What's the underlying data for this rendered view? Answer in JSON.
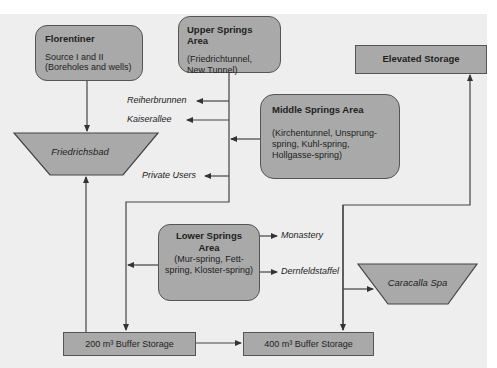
{
  "diagram": {
    "nodes": {
      "florentiner": {
        "title": "Florentiner",
        "line1": "Source I and II",
        "line2": "(Boreholes and wells)"
      },
      "upper_springs": {
        "title": "Upper Springs Area",
        "detail": "(Friedrichtunnel,   New Tunnel)"
      },
      "elevated_storage": {
        "title": "Elevated Storage"
      },
      "friedrichsbad": {
        "label": "Friedrichsbad"
      },
      "middle_springs": {
        "title": "Middle Springs Area",
        "detail": "(Kirchentunnel, Unsprung-spring, Kuhl-spring, Hollgasse-spring)"
      },
      "lower_springs": {
        "title": "Lower Springs Area",
        "detail": "(Mur-spring, Fett-spring, Kloster-spring)"
      },
      "caracalla_spa": {
        "label": "Caracalla Spa"
      },
      "buffer_200": {
        "label": "200 m³ Buffer Storage"
      },
      "buffer_400": {
        "label": "400 m³ Buffer Storage"
      }
    },
    "consumers": {
      "reiherbrunnen": "Reiherbrunnen",
      "kaiserallee": "Kaiserallee",
      "private_users": "Private Users",
      "monastery": "Monastery",
      "dernfeldstaffel": "Dernfeldstaffel"
    },
    "colors": {
      "node_fill": "#a9a9a9",
      "line": "#444444",
      "background": "#eeeeee"
    }
  }
}
